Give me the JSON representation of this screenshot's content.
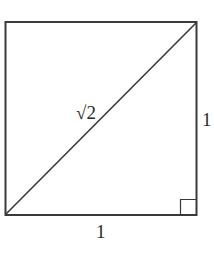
{
  "diagram": {
    "type": "unit-square-with-diagonal",
    "labels": {
      "diagonal": "√2",
      "right_side": "1",
      "bottom_side": "1"
    },
    "right_angle_marker": true,
    "colors": {
      "stroke": "#3a3a3a",
      "text": "#2a2a2a",
      "background": "#ffffff"
    }
  }
}
